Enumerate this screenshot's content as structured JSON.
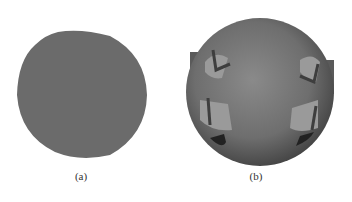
{
  "figure": {
    "panels": [
      {
        "id": "a",
        "label": "(a)",
        "description": "flat grey disc",
        "color": "#6b6b6b"
      },
      {
        "id": "b",
        "label": "(b)",
        "description": "shaded sphere with four protruding wedge features",
        "color": "#707070"
      }
    ]
  }
}
